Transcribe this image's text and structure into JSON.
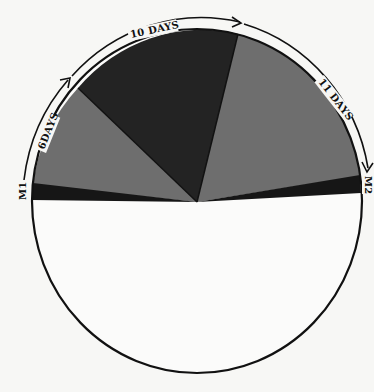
{
  "diagram": {
    "type": "cycle-pie",
    "colors": {
      "background": "#f7f7f5",
      "light_sector": "#6e6e6e",
      "dark_sector": "#232323",
      "band": "#161616",
      "outline": "#111111",
      "empty_half": "#fbfbfa"
    },
    "markers": {
      "start": "M1",
      "end": "M2"
    },
    "intervals": [
      {
        "label": "6DAYS",
        "days": 6,
        "shade": "light"
      },
      {
        "label": "10 DAYS",
        "days": 10,
        "shade": "dark"
      },
      {
        "label": "11 DAYS",
        "days": 11,
        "shade": "light"
      }
    ]
  }
}
